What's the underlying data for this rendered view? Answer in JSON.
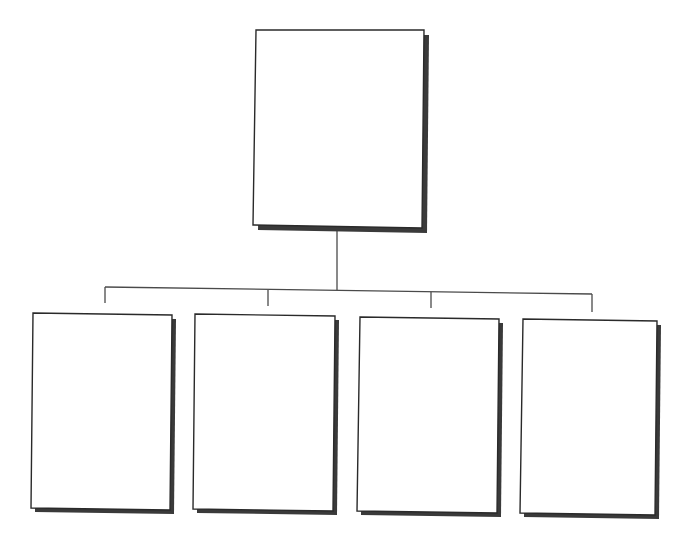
{
  "diagram": {
    "type": "org-chart",
    "levels": 2,
    "colors": {
      "background": "#ffffff",
      "box_fill": "#ffffff",
      "box_border": "#2a2a2a",
      "shadow": "#3a3a3a",
      "connector": "#4a4a4a"
    },
    "root": {
      "label": "",
      "box": {
        "x1": 256,
        "y1": 30,
        "x2": 424,
        "y2": 30,
        "x3": 422,
        "y3": 228,
        "x4": 253,
        "y4": 225
      }
    },
    "children": [
      {
        "label": "",
        "box": {
          "x1": 33,
          "y1": 313,
          "x2": 172,
          "y2": 315,
          "x3": 170,
          "y3": 510,
          "x4": 31,
          "y4": 508
        }
      },
      {
        "label": "",
        "box": {
          "x1": 195,
          "y1": 314,
          "x2": 335,
          "y2": 316,
          "x3": 333,
          "y3": 511,
          "x4": 193,
          "y4": 509
        }
      },
      {
        "label": "",
        "box": {
          "x1": 360,
          "y1": 317,
          "x2": 499,
          "y2": 319,
          "x3": 497,
          "y3": 513,
          "x4": 357,
          "y4": 511
        }
      },
      {
        "label": "",
        "box": {
          "x1": 523,
          "y1": 319,
          "x2": 657,
          "y2": 321,
          "x3": 655,
          "y3": 515,
          "x4": 520,
          "y4": 513
        }
      }
    ],
    "connectors": {
      "trunk": {
        "x1": 337,
        "y1": 228,
        "x2": 337,
        "y2": 290
      },
      "bus": {
        "x1": 105,
        "y1": 287,
        "x2": 592,
        "y2": 294
      },
      "drops": [
        {
          "x1": 105,
          "y1": 287,
          "x2": 105,
          "y2": 303
        },
        {
          "x1": 268,
          "y1": 290,
          "x2": 268,
          "y2": 306
        },
        {
          "x1": 431,
          "y1": 292,
          "x2": 431,
          "y2": 308
        },
        {
          "x1": 592,
          "y1": 294,
          "x2": 592,
          "y2": 312
        }
      ]
    }
  }
}
